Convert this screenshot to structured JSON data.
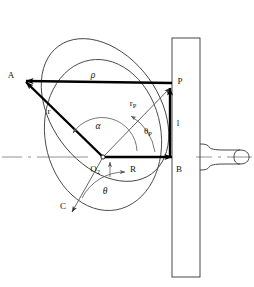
{
  "figure": {
    "background_color": "#ffffff",
    "line_color": "#333333",
    "vector_color": "#000000",
    "thin_line_color": "#555555",
    "centerline_color": "#777777"
  },
  "labels": {
    "point_a": "A",
    "point_p": "P",
    "point_b": "B",
    "point_c": "C",
    "origin": "O",
    "origin_sub": "2",
    "vector_rho": "ρ",
    "vector_r": "r",
    "vector_rp": "r",
    "vector_rp_sub": "P",
    "angle_alpha": "α",
    "angle_theta": "θ",
    "angle_theta_p": "θ",
    "angle_theta_p_sub": "P",
    "radius_r": "R",
    "length_l": "l"
  },
  "elements": {
    "disc_outer": "tilted-ellipse-disc",
    "disc_inner": "upright-ellipse-disc",
    "plate": "vertical-plate",
    "shaft": "horizontal-shaft",
    "axis": "dash-dot-centerline"
  }
}
